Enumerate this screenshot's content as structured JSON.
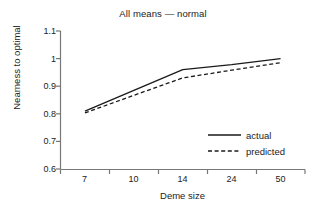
{
  "chart_data": {
    "type": "line",
    "title": "All means — normal",
    "xlabel": "Deme size",
    "ylabel": "Nearness to optimal",
    "categories": [
      "7",
      "10",
      "14",
      "24",
      "50"
    ],
    "series": [
      {
        "name": "actual",
        "style": "solid",
        "values": [
          0.81,
          0.885,
          0.96,
          0.978,
          1.0
        ]
      },
      {
        "name": "predicted",
        "style": "dashed",
        "values": [
          0.803,
          0.867,
          0.93,
          0.958,
          0.985
        ]
      }
    ],
    "yticks": [
      "0.6",
      "0.7",
      "0.8",
      "0.9",
      "1",
      "1.1"
    ],
    "ylim": [
      0.6,
      1.1
    ],
    "grid": false,
    "legend_position": "lower-right",
    "colors": {
      "line": "#1a1a1a",
      "axis": "#555555",
      "text": "#222222"
    }
  },
  "legend": {
    "entries": [
      {
        "label": "actual"
      },
      {
        "label": "predicted"
      }
    ]
  }
}
